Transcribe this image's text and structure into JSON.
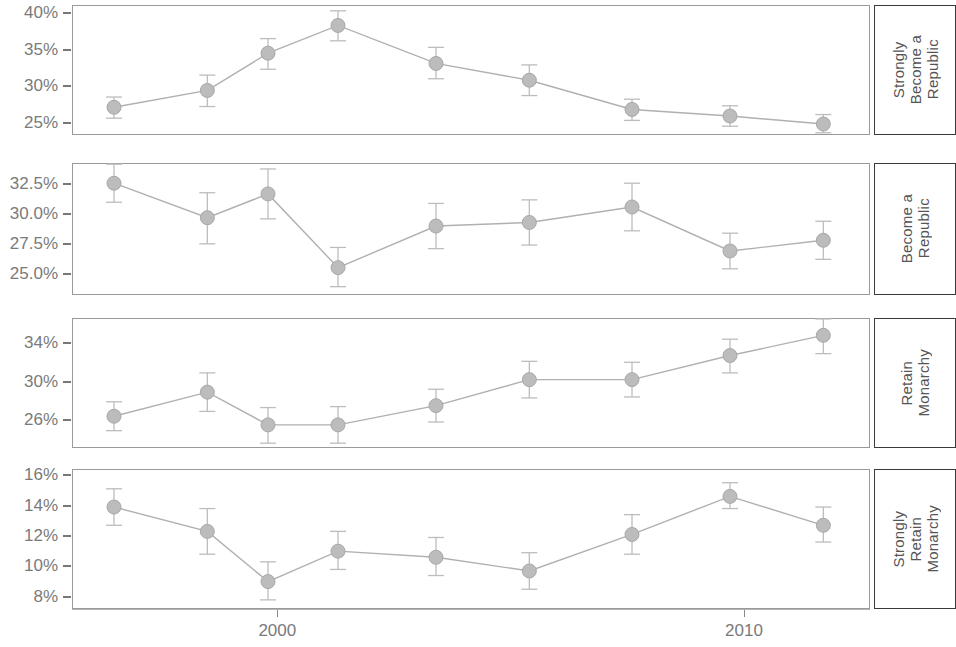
{
  "chart_data": {
    "type": "line",
    "title": "",
    "xlabel": "",
    "ylabel": "",
    "grid": false,
    "legend": "none",
    "error_bars": true,
    "x": [
      1996.5,
      1998.5,
      1999.8,
      2001.3,
      2003.4,
      2005.4,
      2007.6,
      2009.7,
      2011.7
    ],
    "xlim": [
      1995.6,
      2012.7
    ],
    "xticks": [
      2000,
      2010
    ],
    "xticklabels": [
      "2000",
      "2010"
    ],
    "panels": [
      {
        "label": "Strongly\nBecome a\nRepublic",
        "ylim": [
          23.3,
          41.1
        ],
        "yticks": [
          25,
          30,
          35,
          40
        ],
        "yticklabels": [
          "25%",
          "30%",
          "35%",
          "40%"
        ],
        "values": [
          27.1,
          29.4,
          34.5,
          38.3,
          33.1,
          30.8,
          26.8,
          25.9,
          24.8
        ],
        "err_low": [
          25.6,
          27.2,
          32.3,
          36.2,
          31.0,
          28.7,
          25.3,
          24.5,
          23.6
        ],
        "err_high": [
          28.5,
          31.5,
          36.5,
          40.3,
          35.3,
          32.9,
          28.2,
          27.3,
          26.1
        ]
      },
      {
        "label": "Become a\nRepublic",
        "ylim": [
          23.2,
          34.3
        ],
        "yticks": [
          25.0,
          27.5,
          30.0,
          32.5
        ],
        "yticklabels": [
          "25.0%",
          "27.5%",
          "30.0%",
          "32.5%"
        ],
        "values": [
          32.6,
          29.7,
          31.7,
          25.5,
          29.0,
          29.3,
          30.6,
          26.9,
          27.8
        ],
        "err_low": [
          31.0,
          27.5,
          29.6,
          23.9,
          27.1,
          27.4,
          28.6,
          25.4,
          26.2
        ],
        "err_high": [
          34.2,
          31.8,
          33.8,
          27.2,
          30.9,
          31.2,
          32.6,
          28.4,
          29.4
        ]
      },
      {
        "label": "Retain\nMonarchy",
        "ylim": [
          23.1,
          36.6
        ],
        "yticks": [
          26,
          30,
          34
        ],
        "yticklabels": [
          "26%",
          "30%",
          "34%"
        ],
        "values": [
          26.4,
          28.9,
          25.5,
          25.5,
          27.5,
          30.2,
          30.2,
          32.7,
          34.8
        ],
        "err_low": [
          24.9,
          26.9,
          23.6,
          23.6,
          25.8,
          28.3,
          28.4,
          30.9,
          32.9
        ],
        "err_high": [
          27.9,
          30.9,
          27.3,
          27.4,
          29.2,
          32.1,
          32.0,
          34.4,
          36.5
        ]
      },
      {
        "label": "Strongly\nRetain\nMonarchy",
        "ylim": [
          7.2,
          16.4
        ],
        "yticks": [
          8,
          10,
          12,
          14,
          16
        ],
        "yticklabels": [
          "8%",
          "10%",
          "12%",
          "14%",
          "16%"
        ],
        "values": [
          13.9,
          12.3,
          9.0,
          11.0,
          10.6,
          9.7,
          12.1,
          14.6,
          12.7
        ],
        "err_low": [
          12.7,
          10.8,
          7.8,
          9.8,
          9.4,
          8.5,
          10.8,
          13.8,
          11.6
        ],
        "err_high": [
          15.1,
          13.8,
          10.3,
          12.3,
          11.9,
          10.9,
          13.4,
          15.5,
          13.9
        ]
      }
    ],
    "colors": {
      "marker_fill": "#bcbcbc",
      "marker_edge": "#a8a8a8",
      "line": "#b0b0b0",
      "error_bar": "#bdbdbd",
      "panel_border": "#9a9a9a",
      "strip_border": "#3a3a3a",
      "tick_text": "#7a7a7a"
    }
  }
}
